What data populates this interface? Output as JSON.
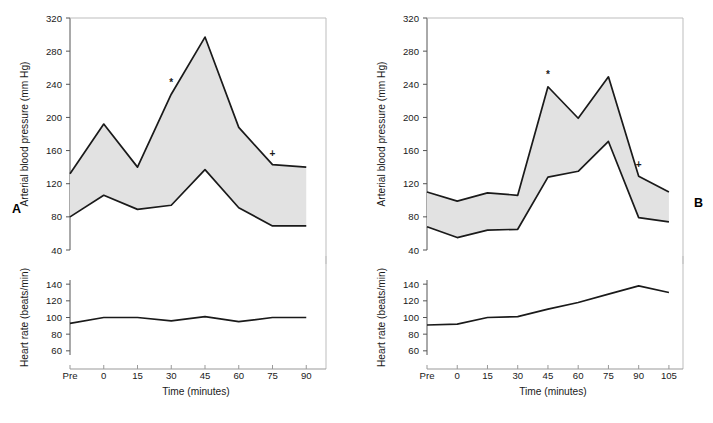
{
  "figure": {
    "panel_a_letter": "A",
    "panel_b_letter": "B"
  },
  "chart_data": [
    {
      "id": "panel-a-bp",
      "panel": "A",
      "type": "area",
      "title": "",
      "xlabel": "Time (minutes)",
      "ylabel": "Arterial blood pressure (mm Hg)",
      "categories": [
        "Pre",
        "0",
        "15",
        "30",
        "45",
        "60",
        "75",
        "90"
      ],
      "x": [
        -15,
        0,
        15,
        30,
        45,
        60,
        75,
        90
      ],
      "xlim": [
        -15,
        97
      ],
      "ylim": [
        40,
        320
      ],
      "yticks": [
        40,
        80,
        120,
        160,
        200,
        240,
        280,
        320
      ],
      "xticks": [
        "Pre",
        "0",
        "15",
        "30",
        "45",
        "60",
        "75",
        "90"
      ],
      "grid": false,
      "legend": "none",
      "fill_color": "#e2e2e2",
      "line_color": "#1a1a1a",
      "series": [
        {
          "name": "Systolic blood pressure",
          "values": [
            132,
            192,
            140,
            228,
            297,
            188,
            143,
            140
          ]
        },
        {
          "name": "Diastolic blood pressure",
          "values": [
            80,
            106,
            89,
            94,
            137,
            91,
            69,
            69
          ]
        }
      ],
      "annotations": [
        {
          "text": "*",
          "x": 30,
          "y": 238
        },
        {
          "text": "+",
          "x": 75,
          "y": 152
        }
      ]
    },
    {
      "id": "panel-a-hr",
      "panel": "A",
      "type": "line",
      "title": "",
      "xlabel": "Time (minutes)",
      "ylabel": "Heart rate (beats/min)",
      "categories": [
        "Pre",
        "0",
        "15",
        "30",
        "45",
        "60",
        "75",
        "90"
      ],
      "x": [
        -15,
        0,
        15,
        30,
        45,
        60,
        75,
        90
      ],
      "xlim": [
        -15,
        97
      ],
      "ylim": [
        55,
        145
      ],
      "yticks": [
        60,
        80,
        100,
        120,
        140
      ],
      "xticks": [
        "Pre",
        "0",
        "15",
        "30",
        "45",
        "60",
        "75",
        "90"
      ],
      "grid": false,
      "legend": "none",
      "line_color": "#1a1a1a",
      "series": [
        {
          "name": "Heart rate",
          "values": [
            93,
            100,
            100,
            96,
            101,
            95,
            100,
            100
          ]
        }
      ]
    },
    {
      "id": "panel-b-bp",
      "panel": "B",
      "type": "area",
      "title": "",
      "xlabel": "Time (minutes)",
      "ylabel": "Arterial blood pressure (mm Hg)",
      "categories": [
        "Pre",
        "0",
        "15",
        "30",
        "45",
        "60",
        "75",
        "90",
        "105"
      ],
      "x": [
        -15,
        0,
        15,
        30,
        45,
        60,
        75,
        90,
        105
      ],
      "xlim": [
        -15,
        110
      ],
      "ylim": [
        40,
        320
      ],
      "yticks": [
        40,
        80,
        120,
        160,
        200,
        240,
        280,
        320
      ],
      "xticks": [
        "Pre",
        "0",
        "15",
        "30",
        "45",
        "60",
        "75",
        "90",
        "105"
      ],
      "grid": false,
      "legend": "none",
      "fill_color": "#e2e2e2",
      "line_color": "#1a1a1a",
      "series": [
        {
          "name": "Systolic blood pressure",
          "values": [
            110,
            99,
            109,
            106,
            237,
            199,
            249,
            129,
            110
          ]
        },
        {
          "name": "Diastolic blood pressure",
          "values": [
            68,
            55,
            64,
            65,
            128,
            135,
            171,
            79,
            74
          ]
        }
      ],
      "annotations": [
        {
          "text": "*",
          "x": 45,
          "y": 247
        },
        {
          "text": "+",
          "x": 90,
          "y": 139
        }
      ]
    },
    {
      "id": "panel-b-hr",
      "panel": "B",
      "type": "line",
      "title": "",
      "xlabel": "Time (minutes)",
      "ylabel": "Heart rate (beats/min)",
      "categories": [
        "Pre",
        "0",
        "15",
        "30",
        "45",
        "60",
        "75",
        "90",
        "105"
      ],
      "x": [
        -15,
        0,
        15,
        30,
        45,
        60,
        75,
        90,
        105
      ],
      "xlim": [
        -15,
        110
      ],
      "ylim": [
        55,
        145
      ],
      "yticks": [
        60,
        80,
        100,
        120,
        140
      ],
      "xticks": [
        "Pre",
        "0",
        "15",
        "30",
        "45",
        "60",
        "75",
        "90",
        "105"
      ],
      "grid": false,
      "legend": "none",
      "line_color": "#1a1a1a",
      "series": [
        {
          "name": "Heart rate",
          "values": [
            91,
            92,
            100,
            101,
            110,
            118,
            128,
            138,
            130
          ]
        }
      ]
    }
  ]
}
